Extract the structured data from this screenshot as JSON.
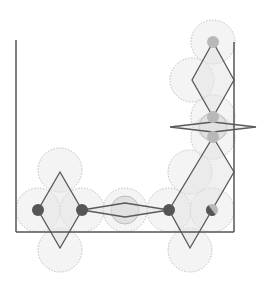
{
  "diagram": {
    "title": "",
    "colors": {
      "background": "#ffffff",
      "frame": "#555555",
      "rhombus_stroke": "#5a5a5a",
      "rhombus_fill": "#e4e4e4",
      "circle_fill": "#ebebeb",
      "circle_stroke": "#bdbdbd",
      "dark_node": "#555555",
      "gray_node": "#b8b8b8"
    },
    "frame": {
      "left": {
        "x": 16,
        "y1": 40,
        "y2": 232
      },
      "bottom": {
        "y": 232,
        "x1": 16,
        "x2": 234
      },
      "right": {
        "x": 234,
        "y1": 42,
        "y2": 232
      }
    },
    "circles": [
      {
        "cx": 60,
        "cy": 170,
        "r": 22
      },
      {
        "cx": 38,
        "cy": 210,
        "r": 22
      },
      {
        "cx": 82,
        "cy": 210,
        "r": 22
      },
      {
        "cx": 60,
        "cy": 250,
        "r": 22
      },
      {
        "cx": 125,
        "cy": 210,
        "r": 22
      },
      {
        "cx": 125,
        "cy": 210,
        "r": 14,
        "shade": true
      },
      {
        "cx": 169,
        "cy": 210,
        "r": 22
      },
      {
        "cx": 190,
        "cy": 172,
        "r": 22
      },
      {
        "cx": 190,
        "cy": 250,
        "r": 22
      },
      {
        "cx": 212,
        "cy": 210,
        "r": 22
      },
      {
        "cx": 213,
        "cy": 42,
        "r": 22
      },
      {
        "cx": 192,
        "cy": 80,
        "r": 22
      },
      {
        "cx": 213,
        "cy": 117,
        "r": 22
      },
      {
        "cx": 213,
        "cy": 137,
        "r": 22
      },
      {
        "cx": 213,
        "cy": 127,
        "r": 14,
        "shade": true
      }
    ],
    "rhombi": [
      {
        "name": "left-rhombus",
        "points": "60,172 82,210 60,248 38,210"
      },
      {
        "name": "bottom-lens",
        "points": "82,210 125,203 169,210 125,217"
      },
      {
        "name": "large-rhombus",
        "points": "213,137 234,172 190,248 169,210"
      },
      {
        "name": "top-rhombus",
        "points": "213,42 234,80 213,117 192,80"
      },
      {
        "name": "right-lens",
        "points": "170,127 213,122 256,127 213,132"
      }
    ],
    "nodes": [
      {
        "name": "node-left",
        "cx": 38,
        "cy": 210,
        "r": 6,
        "type": "dark"
      },
      {
        "name": "node-mid-left",
        "cx": 82,
        "cy": 210,
        "r": 6,
        "type": "dark"
      },
      {
        "name": "node-mid-right",
        "cx": 169,
        "cy": 210,
        "r": 6,
        "type": "dark"
      },
      {
        "name": "node-corner",
        "cx": 212,
        "cy": 210,
        "r": 6,
        "type": "half"
      },
      {
        "name": "node-top",
        "cx": 213,
        "cy": 42,
        "r": 6,
        "type": "gray"
      },
      {
        "name": "node-upper",
        "cx": 213,
        "cy": 117,
        "r": 6,
        "type": "gray"
      },
      {
        "name": "node-lower",
        "cx": 213,
        "cy": 137,
        "r": 6,
        "type": "gray"
      }
    ]
  }
}
